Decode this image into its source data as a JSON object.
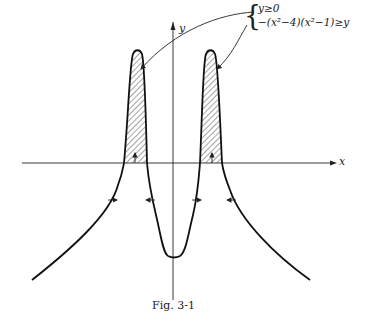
{
  "figure": {
    "caption": "Fig. 3-1",
    "axes": {
      "x_label": "x",
      "y_label": "y"
    },
    "region_conditions": {
      "line1": "y≥0",
      "line2": "−(x²−4)(x²−1)≥y"
    },
    "curve": "y = -(x^2-4)(x^2-1)",
    "shaded_regions": [
      "left hump above x-axis",
      "right hump above x-axis"
    ],
    "colors": {
      "ink": "#222222",
      "background": "#ffffff"
    }
  }
}
